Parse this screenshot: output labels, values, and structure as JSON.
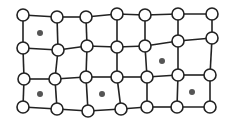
{
  "diagram": {
    "type": "distorted-lattice",
    "colors": {
      "background": "#ffffff",
      "edge": "#222222",
      "node_fill": "#ffffff",
      "node_stroke": "#222222",
      "dot": "#555555"
    },
    "node_radius": 6,
    "dot_radius": 3,
    "rows": [
      [
        [
          23,
          15
        ],
        [
          57,
          17
        ],
        [
          86,
          17
        ],
        [
          117,
          14
        ],
        [
          145,
          15
        ],
        [
          178,
          14
        ],
        [
          212,
          14
        ]
      ],
      [
        [
          23,
          48
        ],
        [
          58,
          50
        ],
        [
          87,
          46
        ],
        [
          117,
          47
        ],
        [
          145,
          46
        ],
        [
          178,
          41
        ],
        [
          212,
          38
        ]
      ],
      [
        [
          24,
          79
        ],
        [
          55,
          79
        ],
        [
          86,
          77
        ],
        [
          117,
          77
        ],
        [
          147,
          77
        ],
        [
          178,
          75
        ],
        [
          210,
          75
        ]
      ],
      [
        [
          23,
          107
        ],
        [
          57,
          109
        ],
        [
          88,
          111
        ],
        [
          121,
          109
        ],
        [
          147,
          107
        ],
        [
          177,
          107
        ],
        [
          210,
          107
        ]
      ]
    ],
    "dots": [
      [
        40,
        33
      ],
      [
        162,
        61
      ],
      [
        40,
        94
      ],
      [
        102,
        94
      ],
      [
        192,
        92
      ]
    ]
  }
}
